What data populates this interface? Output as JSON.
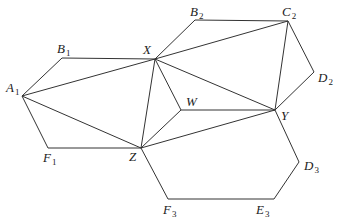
{
  "diagram": {
    "type": "geometry-figure",
    "width": 338,
    "height": 221,
    "stroke_color": "#333333",
    "points": {
      "A1": {
        "x": 22,
        "y": 96,
        "label": "A",
        "sub": "1",
        "lx": 6,
        "ly": 92
      },
      "B1": {
        "x": 62,
        "y": 58,
        "label": "B",
        "sub": "1",
        "lx": 57,
        "ly": 53
      },
      "X": {
        "x": 155,
        "y": 59,
        "label": "X",
        "sub": "",
        "lx": 143,
        "ly": 54
      },
      "B2": {
        "x": 195,
        "y": 20,
        "label": "B",
        "sub": "2",
        "lx": 190,
        "ly": 16
      },
      "C2": {
        "x": 288,
        "y": 21,
        "label": "C",
        "sub": "2",
        "lx": 282,
        "ly": 16
      },
      "D2": {
        "x": 314,
        "y": 72,
        "label": "D",
        "sub": "2",
        "lx": 318,
        "ly": 82
      },
      "Y": {
        "x": 275,
        "y": 110,
        "label": "Y",
        "sub": "",
        "lx": 281,
        "ly": 120
      },
      "W": {
        "x": 181,
        "y": 110,
        "label": "W",
        "sub": "",
        "lx": 186,
        "ly": 106
      },
      "Z": {
        "x": 141,
        "y": 148,
        "label": "Z",
        "sub": "",
        "lx": 129,
        "ly": 161
      },
      "F1": {
        "x": 48,
        "y": 148,
        "label": "F",
        "sub": "1",
        "lx": 43,
        "ly": 162
      },
      "F3": {
        "x": 168,
        "y": 199,
        "label": "F",
        "sub": "3",
        "lx": 163,
        "ly": 214
      },
      "E3": {
        "x": 274,
        "y": 199,
        "label": "E",
        "sub": "3",
        "lx": 256,
        "ly": 214
      },
      "D3": {
        "x": 299,
        "y": 162,
        "label": "D",
        "sub": "3",
        "lx": 304,
        "ly": 170
      }
    },
    "edges": [
      [
        "A1",
        "B1"
      ],
      [
        "B1",
        "X"
      ],
      [
        "A1",
        "X"
      ],
      [
        "A1",
        "Z"
      ],
      [
        "A1",
        "F1"
      ],
      [
        "F1",
        "Z"
      ],
      [
        "X",
        "B2"
      ],
      [
        "B2",
        "C2"
      ],
      [
        "X",
        "C2"
      ],
      [
        "C2",
        "Y"
      ],
      [
        "C2",
        "D2"
      ],
      [
        "D2",
        "Y"
      ],
      [
        "X",
        "Y"
      ],
      [
        "X",
        "W"
      ],
      [
        "X",
        "Z"
      ],
      [
        "W",
        "Y"
      ],
      [
        "W",
        "Z"
      ],
      [
        "Z",
        "Y"
      ],
      [
        "Y",
        "D3"
      ],
      [
        "D3",
        "E3"
      ],
      [
        "E3",
        "F3"
      ],
      [
        "F3",
        "Z"
      ]
    ],
    "labels": {
      "A1": "A",
      "B1": "B",
      "X": "X",
      "B2": "B",
      "C2": "C",
      "D2": "D",
      "Y": "Y",
      "W": "W",
      "Z": "Z",
      "F1": "F",
      "F3": "F",
      "E3": "E",
      "D3": "D"
    }
  }
}
